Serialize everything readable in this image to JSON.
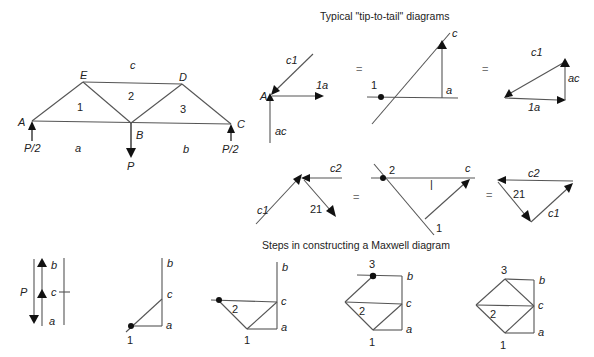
{
  "titles": {
    "top": "Typical \"tip-to-tail\" diagrams",
    "bottom": "Steps in constructing a Maxwell diagram"
  },
  "truss": {
    "nodes": {
      "A": "A",
      "B": "B",
      "C": "C",
      "D": "D",
      "E": "E"
    },
    "regions": {
      "a": "a",
      "b": "b",
      "c": "c",
      "r1": "1",
      "r2": "2",
      "r3": "3"
    },
    "loads": {
      "left_reaction": "P/2",
      "right_reaction": "P/2",
      "center_load": "P"
    }
  },
  "tip_to_tail_row1": {
    "free_body": {
      "node": "A",
      "c1": "c1",
      "one_a": "1a",
      "ac": "ac"
    },
    "equals_1": "=",
    "construction": {
      "c": "c",
      "one": "1",
      "a": "a"
    },
    "equals_2": "=",
    "triangle": {
      "c1": "c1",
      "ac": "ac",
      "one_a": "1a"
    }
  },
  "divider": "|",
  "tip_to_tail_row2": {
    "free_body": {
      "c1": "c1",
      "c2": "c2",
      "twenty_one": "21"
    },
    "equals_1": "=",
    "construction": {
      "two": "2",
      "c": "c",
      "one": "1"
    },
    "equals_2": "=",
    "triangle": {
      "c2": "c2",
      "twenty_one": "21",
      "c1": "c1"
    }
  },
  "maxwell_steps": [
    {
      "step": 1,
      "labels": {
        "P": "P",
        "b": "b",
        "c": "c",
        "a": "a"
      }
    },
    {
      "step": 2,
      "labels": {
        "b": "b",
        "c": "c",
        "a": "a",
        "one": "1"
      }
    },
    {
      "step": 3,
      "labels": {
        "b": "b",
        "c": "c",
        "a": "a",
        "one": "1",
        "two": "2"
      }
    },
    {
      "step": 4,
      "labels": {
        "three": "3",
        "b": "b",
        "c": "c",
        "a": "a",
        "one": "1",
        "two": "2"
      }
    },
    {
      "step": 5,
      "labels": {
        "three": "3",
        "b": "b",
        "c": "c",
        "a": "a",
        "one": "1",
        "two": "2"
      }
    }
  ]
}
